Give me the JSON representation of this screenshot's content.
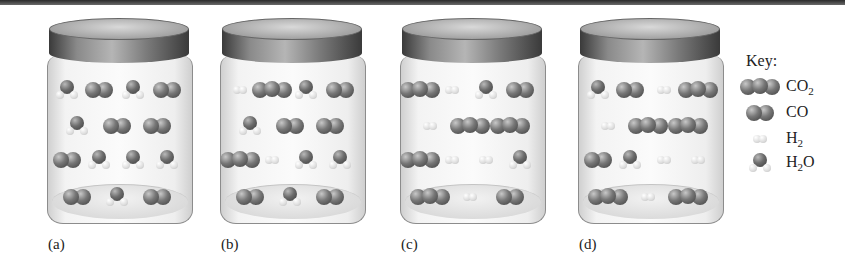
{
  "figure": {
    "jars": [
      {
        "label": "(a)",
        "left": 47,
        "rows": [
          [
            "H2O",
            "CO",
            "H2O",
            "CO"
          ],
          [
            "H2O",
            "CO",
            "CO"
          ],
          [
            "CO",
            "H2O",
            "H2O",
            "H2O"
          ],
          [
            "CO",
            "H2O",
            "CO"
          ]
        ]
      },
      {
        "label": "(b)",
        "left": 220,
        "rows": [
          [
            "H2",
            "CO2",
            "H2O",
            "CO"
          ],
          [
            "H2O",
            "CO",
            "CO"
          ],
          [
            "CO2",
            "H2",
            "H2O",
            "H2O"
          ],
          [
            "CO",
            "H2O",
            "CO"
          ]
        ]
      },
      {
        "label": "(c)",
        "left": 400,
        "rows": [
          [
            "CO2",
            "H2",
            "H2O",
            "CO"
          ],
          [
            "H2",
            "CO2",
            "CO2"
          ],
          [
            "CO2",
            "H2",
            "H2",
            "H2O"
          ],
          [
            "CO2",
            "H2",
            "CO"
          ]
        ]
      },
      {
        "label": "(d)",
        "left": 578,
        "rows": [
          [
            "H2O",
            "CO",
            "H2",
            "CO2"
          ],
          [
            "H2",
            "CO2",
            "CO2"
          ],
          [
            "CO",
            "H2O",
            "H2",
            "H2"
          ],
          [
            "CO2",
            "H2",
            "CO2"
          ]
        ]
      }
    ],
    "key": {
      "title": "Key:",
      "items": [
        {
          "molecule": "CO2",
          "base": "CO",
          "sub": "2",
          "tail": ""
        },
        {
          "molecule": "CO",
          "base": "CO",
          "sub": "",
          "tail": ""
        },
        {
          "molecule": "H2",
          "base": "H",
          "sub": "2",
          "tail": ""
        },
        {
          "molecule": "H2O",
          "base": "H",
          "sub": "2",
          "tail": "O"
        }
      ]
    },
    "colors": {
      "carbon_oxygen": "#6a6a6a",
      "hydrogen": "#dcdcdc",
      "lid": "#5a5a5a",
      "rule": "#3a3a3a"
    }
  }
}
